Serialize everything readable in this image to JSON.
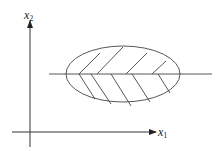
{
  "diagram": {
    "axes": {
      "x": {
        "label": "x",
        "subscript": "1"
      },
      "y": {
        "label": "x",
        "subscript": "2"
      }
    },
    "colors": {
      "stroke": "#333333",
      "background": "#ffffff"
    },
    "elements": [
      "horizontal line crossing ellipse",
      "ellipse with hatched interior",
      "upper half hatch slanting up-right",
      "lower half hatch slanting down-right"
    ]
  }
}
